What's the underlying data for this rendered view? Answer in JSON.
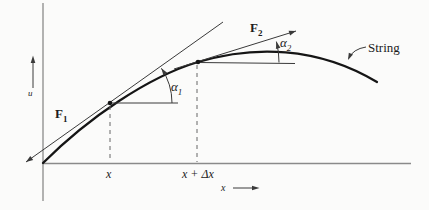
{
  "colors": {
    "background": "#fbfbfa",
    "axis_line": "#8a8a8a",
    "thin_line": "#3a3a3a",
    "string_curve": "#151515",
    "dashed_line": "#666666",
    "text": "#1c1c1c"
  },
  "axes": {
    "vertical_axis_label": "u",
    "horizontal_axis_label": "x"
  },
  "ticks": {
    "x_label": "x",
    "x_plus_dx_label": "x + Δx"
  },
  "forces": {
    "f1": {
      "base": "F",
      "sub": "1"
    },
    "f2": {
      "base": "F",
      "sub": "2"
    }
  },
  "angles": {
    "alpha1": {
      "base": "α",
      "sub": "1"
    },
    "alpha2": {
      "base": "α",
      "sub": "2"
    }
  },
  "annotations": {
    "string_label": "String"
  }
}
